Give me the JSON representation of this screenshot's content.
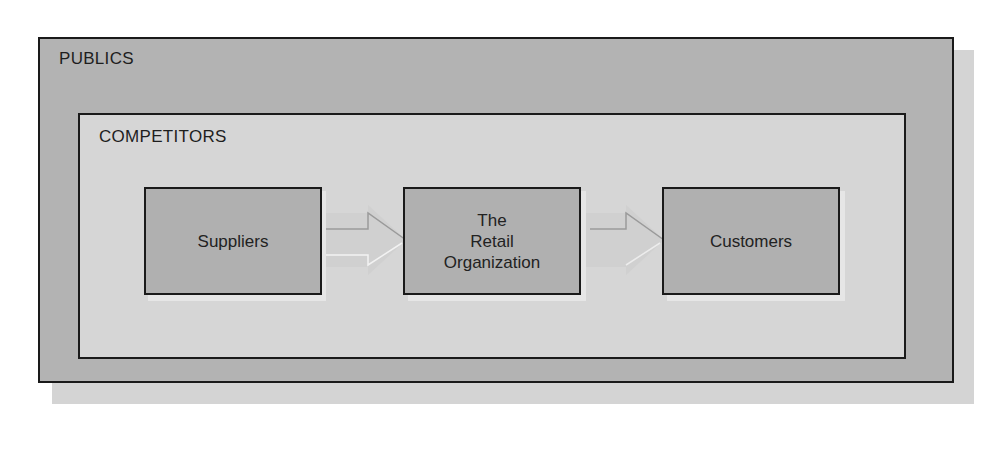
{
  "diagram": {
    "outer": {
      "label": "PUBLICS"
    },
    "inner": {
      "label": "COMPETITORS"
    },
    "nodes": [
      {
        "id": "suppliers",
        "label": "Suppliers"
      },
      {
        "id": "retail",
        "label": "The\nRetail\nOrganization"
      },
      {
        "id": "customers",
        "label": "Customers"
      }
    ],
    "edges": [
      {
        "from": "suppliers",
        "to": "retail"
      },
      {
        "from": "retail",
        "to": "customers"
      }
    ]
  },
  "colors": {
    "outer_fill": "#b3b3b3",
    "inner_fill": "#d6d6d6",
    "node_fill": "#b0b0b0",
    "border": "#1a1a1a",
    "arrow_fill": "#d0d0d0"
  }
}
